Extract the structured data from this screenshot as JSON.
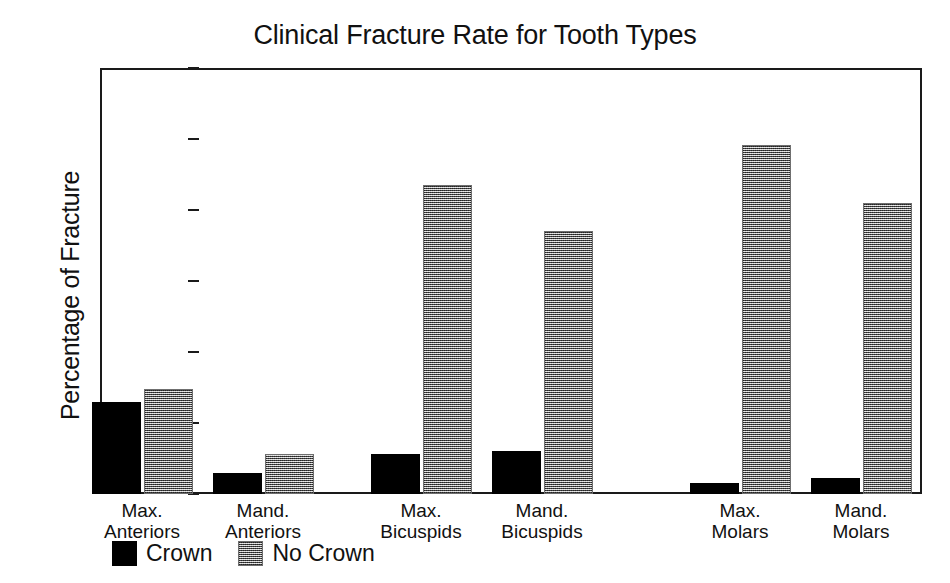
{
  "chart_data": {
    "type": "bar",
    "title": "Clinical Fracture Rate for Tooth Types",
    "xlabel": "",
    "ylabel": "Percentage of Fracture",
    "ylim": [
      0,
      60
    ],
    "yticks": [
      0,
      10,
      20,
      30,
      40,
      50,
      60
    ],
    "grid": false,
    "legend_position": "below-axis-left",
    "categories": [
      "Max. Anteriors",
      "Mand. Anteriors",
      "Max. Bicuspids",
      "Mand. Bicuspids",
      "Max. Molars",
      "Mand. Molars"
    ],
    "category_lines": [
      [
        "Max.",
        "Anteriors"
      ],
      [
        "Mand.",
        "Anteriors"
      ],
      [
        "Max.",
        "Bicuspids"
      ],
      [
        "Mand.",
        "Bicuspids"
      ],
      [
        "Max.",
        "Molars"
      ],
      [
        "Mand.",
        "Molars"
      ]
    ],
    "series": [
      {
        "name": "Crown",
        "color": "#000000",
        "pattern": "solid-black",
        "values": [
          13.0,
          2.9,
          5.7,
          6.0,
          1.5,
          2.3
        ]
      },
      {
        "name": "No Crown",
        "color": "#8a8a8a",
        "pattern": "checkered-gray",
        "values": [
          14.8,
          5.7,
          43.5,
          37.1,
          49.2,
          41.0
        ]
      }
    ]
  },
  "legend": {
    "entries": [
      {
        "label": "Crown",
        "swatch": "solid-black-swatch"
      },
      {
        "label": "No Crown",
        "swatch": "checkered-gray-swatch"
      }
    ]
  }
}
